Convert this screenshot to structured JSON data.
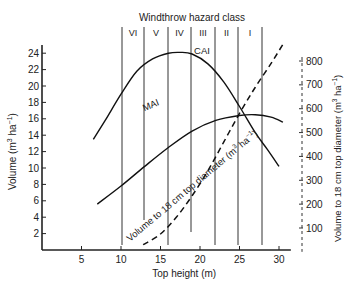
{
  "chart_data": {
    "type": "line",
    "title": "Windthrow hazard class",
    "xlabel": "Top height (m)",
    "ylabel": "Volume (m³ ha⁻¹)",
    "ylabel_right": "Volume to 18 cm top diameter (m³ ha⁻¹)",
    "xlim": [
      0,
      31
    ],
    "ylim": [
      0,
      24
    ],
    "ylim_right": [
      0,
      800
    ],
    "x_ticks": [
      5,
      10,
      15,
      20,
      25,
      30
    ],
    "y_ticks": [
      2,
      4,
      6,
      8,
      10,
      12,
      14,
      16,
      18,
      20,
      22,
      24
    ],
    "y_ticks_right": [
      100,
      200,
      300,
      400,
      500,
      600,
      700,
      800
    ],
    "hazard_classes": {
      "labels": [
        "VI",
        "V",
        "IV",
        "III",
        "II",
        "I"
      ],
      "boundaries_x": [
        10,
        12.9,
        15.9,
        18.8,
        21.9,
        24.8,
        27.8
      ]
    },
    "series": [
      {
        "name": "CAI",
        "axis": "left",
        "style": "solid",
        "x": [
          6.5,
          8,
          10,
          12,
          14,
          16,
          17.5,
          19,
          21,
          23,
          25,
          27,
          28.5,
          30
        ],
        "y": [
          13.5,
          15.8,
          19.0,
          21.8,
          23.3,
          24.0,
          24.1,
          23.9,
          22.7,
          20.5,
          17.5,
          14.3,
          12.3,
          10.2
        ]
      },
      {
        "name": "MAI",
        "axis": "left",
        "style": "solid",
        "x": [
          7,
          10,
          13,
          16,
          19,
          22,
          25,
          27,
          29,
          30.5
        ],
        "y": [
          5.6,
          7.8,
          10.2,
          12.5,
          14.5,
          15.8,
          16.4,
          16.5,
          16.2,
          15.6
        ]
      },
      {
        "name": "Volume to 18 cm top diameter",
        "axis": "right",
        "style": "dashed",
        "x": [
          12.8,
          15,
          17,
          19,
          21,
          23,
          25,
          27,
          29,
          30.5
        ],
        "y": [
          30,
          75,
          145,
          235,
          340,
          460,
          580,
          690,
          790,
          870
        ]
      }
    ],
    "annotations": [
      "CAI",
      "MAI",
      "Volume to 18 cm top diameter (m³ ha⁻¹)"
    ],
    "grid": false,
    "legend": "none"
  },
  "labels": {
    "title": "Windthrow hazard class",
    "xlabel": "Top height (m)",
    "ylabel_main": "Volume (m",
    "ylabel_sup1": "3",
    "ylabel_mid": " ha",
    "ylabel_sup2": "−1",
    "ylabel_end": ")",
    "ylabel_right_main": "Volume to 18 cm top diameter (m",
    "curve_cai": "CAI",
    "curve_mai": "MAI",
    "curve_vol": "Volume to 18 cm top diameter (m",
    "classes": [
      "VI",
      "V",
      "IV",
      "III",
      "II",
      "I"
    ],
    "x_ticks": [
      "5",
      "10",
      "15",
      "20",
      "25",
      "30"
    ],
    "y_ticks": [
      "2",
      "4",
      "6",
      "8",
      "10",
      "12",
      "14",
      "16",
      "18",
      "20",
      "22",
      "24"
    ],
    "y_ticks_right": [
      "100",
      "200",
      "300",
      "400",
      "500",
      "600",
      "700",
      "800"
    ]
  }
}
